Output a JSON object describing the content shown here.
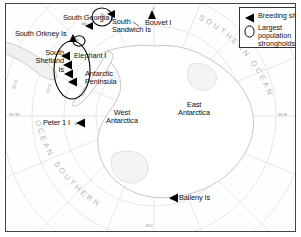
{
  "map": {
    "title": "Antarctic breeding sites and population strongholds map",
    "projection": "south-polar-stereographic",
    "frame_color": "#444444",
    "land_fill": "#ffffff",
    "land_stroke": "#b0b0b0",
    "graticule_color": "#d9d9d9",
    "ocean_label_color": "#b4b4b4",
    "marker_color": "#000000"
  },
  "legend": {
    "breeding_site_label": "Breeding site",
    "stronghold_label": "Largest\npopulation\nstrongholds",
    "breeding_icon": "triangle-left-icon",
    "stronghold_icon": "ellipse-outline-icon"
  },
  "place_labels": [
    {
      "id": "south-georgia",
      "text": "South Georgia I",
      "x": 59,
      "y": 13,
      "align": "left"
    },
    {
      "id": "south-sandwich",
      "text": "South\nSandwich Is",
      "x": 105,
      "y": 17,
      "align": "left"
    },
    {
      "id": "bouvet",
      "text": "Bouvet I",
      "x": 141,
      "y": 17,
      "align": "left"
    },
    {
      "id": "south-orkney",
      "text": "South Orkney Is",
      "x": 11,
      "y": 29,
      "align": "left"
    },
    {
      "id": "south-shetland",
      "text": "South\nShetland\nIs",
      "x": 26,
      "y": 48,
      "align": "right"
    },
    {
      "id": "elephant",
      "text": "Elephant I",
      "x": 72,
      "y": 53,
      "align": "left"
    },
    {
      "id": "antarctic-peninsula",
      "text": "Antarctic\nPeninsula",
      "x": 82,
      "y": 71,
      "align": "left"
    },
    {
      "id": "west-antarctica",
      "text": "West\nAntarctica",
      "x": 100,
      "y": 108,
      "align": "left"
    },
    {
      "id": "east-antarctica",
      "text": "East\nAntarctica",
      "x": 175,
      "y": 100,
      "align": "left"
    },
    {
      "id": "peter-1",
      "text": "Peter 1 I",
      "x": 40,
      "y": 118,
      "align": "left"
    },
    {
      "id": "balleny",
      "text": "Balleny Is",
      "x": 172,
      "y": 193,
      "align": "left"
    }
  ],
  "ocean_labels": [
    {
      "id": "southern-ocean-ne",
      "text": "SOUTHERN OCEAN"
    },
    {
      "id": "southern-ocean-sw",
      "text": "SOUTHERN OCEAN"
    }
  ],
  "graticule_labels": [
    {
      "id": "lon-0",
      "text": "0°",
      "x": 148,
      "y": 5
    },
    {
      "id": "lon-90w",
      "text": "90°W",
      "x": 8,
      "y": 111
    },
    {
      "id": "lon-90e",
      "text": "90°E",
      "x": 276,
      "y": 111
    },
    {
      "id": "lon-180",
      "text": "180°",
      "x": 141,
      "y": 215
    },
    {
      "id": "lat-50s",
      "text": "50°S",
      "x": 10,
      "y": 88
    },
    {
      "id": "lat-60s",
      "text": "60°S",
      "x": 44,
      "y": 92
    },
    {
      "id": "lat-70s",
      "text": "70°S",
      "x": 79,
      "y": 96
    }
  ],
  "markers": {
    "breeding_sites": [
      {
        "id": "south-georgia-marker",
        "x": 79,
        "y": 22
      },
      {
        "id": "south-sandwich-marker",
        "x": 104,
        "y": 11
      },
      {
        "id": "bouvet-marker",
        "x": 146,
        "y": 10
      },
      {
        "id": "south-orkney-marker",
        "x": 67,
        "y": 33
      },
      {
        "id": "peninsula-marker-1",
        "x": 58,
        "y": 52
      },
      {
        "id": "peninsula-marker-2",
        "x": 60,
        "y": 61
      },
      {
        "id": "peninsula-marker-3",
        "x": 61,
        "y": 70
      },
      {
        "id": "peninsula-marker-4",
        "x": 65,
        "y": 78
      },
      {
        "id": "peter-1-marker",
        "x": 71,
        "y": 119
      },
      {
        "id": "balleny-marker",
        "x": 164,
        "y": 194
      }
    ],
    "strongholds": [
      {
        "id": "south-sandwich-ellipse",
        "cx": 96,
        "cy": 13,
        "rx": 10,
        "ry": 9
      },
      {
        "id": "south-orkney-ellipse",
        "cx": 73,
        "cy": 37,
        "rx": 6,
        "ry": 5
      },
      {
        "id": "peninsula-ellipse",
        "cx": 66,
        "cy": 66,
        "rx": 18,
        "ry": 29
      }
    ]
  }
}
